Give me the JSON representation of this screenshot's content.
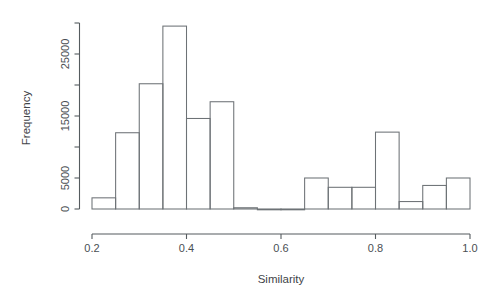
{
  "chart_data": {
    "type": "bar",
    "title": "",
    "subtitle": "",
    "xlabel": "Similarity",
    "ylabel": "Frequency",
    "xlim": [
      0.2,
      1.0
    ],
    "ylim": [
      0,
      30000
    ],
    "grid": false,
    "legend": null,
    "bin_width": 0.05,
    "x_ticks": [
      "0.2",
      "0.4",
      "0.6",
      "0.8",
      "1.0"
    ],
    "x_tick_values": [
      0.2,
      0.4,
      0.6,
      0.8,
      1.0
    ],
    "y_ticks": [
      "0",
      "5000",
      "15000",
      "25000"
    ],
    "y_tick_values": [
      0,
      5000,
      15000,
      25000
    ],
    "y_minor_tick_values": [
      10000,
      20000,
      30000
    ],
    "bin_edges": [
      0.2,
      0.25,
      0.3,
      0.35,
      0.4,
      0.45,
      0.5,
      0.55,
      0.6,
      0.65,
      0.7,
      0.75,
      0.8,
      0.85,
      0.9,
      0.95,
      1.0
    ],
    "categories": [
      "0.20-0.25",
      "0.25-0.30",
      "0.30-0.35",
      "0.35-0.40",
      "0.40-0.45",
      "0.45-0.50",
      "0.50-0.55",
      "0.55-0.60",
      "0.60-0.65",
      "0.65-0.70",
      "0.70-0.75",
      "0.75-0.80",
      "0.80-0.85",
      "0.85-0.90",
      "0.90-0.95",
      "0.95-1.00"
    ],
    "values": [
      1800,
      12300,
      20200,
      29500,
      14600,
      17300,
      200,
      0,
      0,
      5000,
      3500,
      3500,
      12400,
      1200,
      3800,
      5000
    ]
  },
  "axes": {
    "x_title": "Similarity",
    "y_title": "Frequency"
  }
}
